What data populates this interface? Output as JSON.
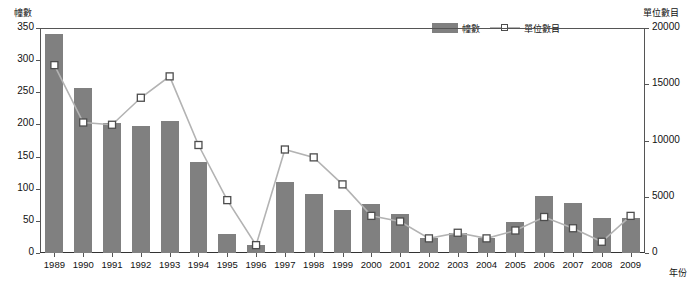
{
  "chart_data": {
    "type": "bar",
    "title": "",
    "xlabel": "年份",
    "ylabel": "幢數",
    "y2label": "單位數目",
    "grid": false,
    "legend_position": "top-right",
    "categories": [
      "1989",
      "1990",
      "1991",
      "1992",
      "1993",
      "1994",
      "1995",
      "1996",
      "1997",
      "1998",
      "1999",
      "2000",
      "2001",
      "2002",
      "2003",
      "2004",
      "2005",
      "2006",
      "2007",
      "2008",
      "2009"
    ],
    "ylim": [
      0,
      350
    ],
    "yticks": [
      0,
      50,
      100,
      150,
      200,
      250,
      300,
      350
    ],
    "y2lim": [
      0,
      20000
    ],
    "y2ticks": [
      0,
      5000,
      10000,
      15000,
      20000
    ],
    "series": [
      {
        "name": "幢數",
        "type": "bar",
        "axis": "left",
        "color": "#808080",
        "values": [
          341,
          257,
          202,
          197,
          206,
          142,
          30,
          13,
          110,
          92,
          67,
          76,
          61,
          23,
          31,
          24,
          49,
          88,
          78,
          54,
          55
        ]
      },
      {
        "name": "單位數目",
        "type": "line",
        "axis": "right",
        "color": "#b3b3b3",
        "marker": "square",
        "values": [
          16700,
          11600,
          11400,
          13800,
          15700,
          9600,
          4700,
          700,
          9200,
          8500,
          6100,
          3300,
          2800,
          1300,
          1800,
          1300,
          2000,
          3200,
          2200,
          1000,
          3300
        ]
      }
    ],
    "ytick_labels": [
      "0",
      "50",
      "100",
      "150",
      "200",
      "250",
      "300",
      "350"
    ],
    "y2tick_labels": [
      "0",
      "5000",
      "10000",
      "15000",
      "20000"
    ]
  },
  "legend": {
    "items": [
      {
        "label": "幢數",
        "kind": "bar-swatch"
      },
      {
        "label": "單位數目",
        "kind": "line-swatch"
      }
    ]
  }
}
